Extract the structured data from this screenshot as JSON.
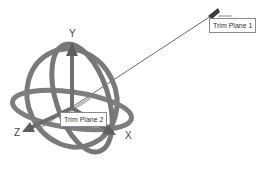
{
  "view": {
    "background": "#ffffff",
    "ring_color": "#7a7a7a",
    "arrow_color": "#6e6e6e"
  },
  "triad": {
    "axes": [
      {
        "name": "x",
        "label": "X"
      },
      {
        "name": "y",
        "label": "Y"
      },
      {
        "name": "z",
        "label": "Z"
      }
    ]
  },
  "callouts": [
    {
      "name": "trim-plane-1",
      "label": "Trim Plane 1"
    },
    {
      "name": "trim-plane-2",
      "label": "Trim Plane 2"
    }
  ]
}
